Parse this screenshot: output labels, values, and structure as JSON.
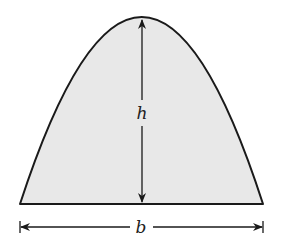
{
  "diagram": {
    "shape": "parabolic-arch",
    "colors": {
      "fill": "#e8e8e8",
      "stroke": "#1a1a1a",
      "background": "#ffffff"
    },
    "labels": {
      "height": "h",
      "base": "b"
    }
  }
}
